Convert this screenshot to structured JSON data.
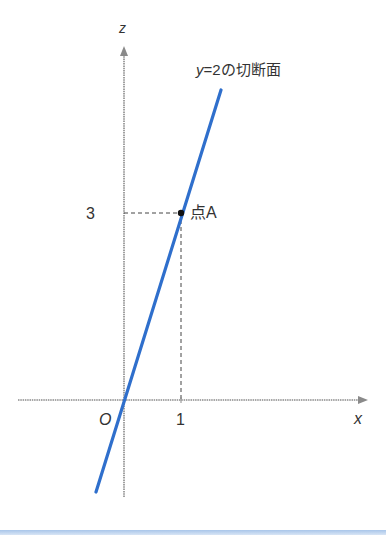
{
  "diagram": {
    "axes": {
      "z_label": "z",
      "x_label": "x",
      "origin_label": "O",
      "z_tick": "3",
      "x_tick": "1"
    },
    "line_label": {
      "var": "y",
      "rest": "=2の切断面"
    },
    "point_label": "点A",
    "colors": {
      "line": "#2f6fcc",
      "axis": "#8a8a8a",
      "text": "#333333",
      "band": "#a9c6ea"
    }
  }
}
